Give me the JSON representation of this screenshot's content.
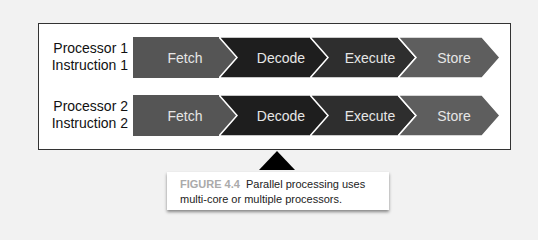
{
  "rows": [
    {
      "label_line1": "Processor 1",
      "label_line2": "Instruction 1",
      "stages": [
        "Fetch",
        "Decode",
        "Execute",
        "Store"
      ]
    },
    {
      "label_line1": "Processor 2",
      "label_line2": "Instruction 2",
      "stages": [
        "Fetch",
        "Decode",
        "Execute",
        "Store"
      ]
    }
  ],
  "stage_colors": {
    "fetch": "#555555",
    "decode": "#1e1e1e",
    "execute": "#2e2e2e",
    "store": "#5e5e5e"
  },
  "caption": {
    "figure_label": "FIGURE 4.4",
    "text": "Parallel processing uses multi-core or multiple processors."
  }
}
